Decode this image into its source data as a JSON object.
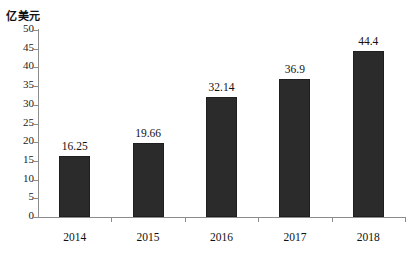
{
  "chart_data": {
    "type": "bar",
    "title": "",
    "subtitle": "",
    "xlabel": "",
    "ylabel": "亿美元",
    "categories": [
      "2014",
      "2015",
      "2016",
      "2017",
      "2018"
    ],
    "values": [
      16.25,
      19.66,
      32.14,
      36.9,
      44.4
    ],
    "value_labels": [
      "16.25",
      "19.66",
      "32.14",
      "36.9",
      "44.4"
    ],
    "series": [
      {
        "name": "亿美元",
        "values": [
          16.25,
          19.66,
          32.14,
          36.9,
          44.4
        ],
        "color": "#2b2b2b"
      }
    ],
    "ylim": [
      0,
      50
    ],
    "yticks": [
      0,
      5,
      10,
      15,
      20,
      25,
      30,
      35,
      40,
      45,
      50
    ],
    "ytick_labels": [
      "0",
      "5",
      "10",
      "15",
      "20",
      "25",
      "30",
      "35",
      "40",
      "45",
      "50"
    ],
    "grid": false,
    "legend": false,
    "legend_position": "none",
    "axis_color": "#8c8c8c",
    "background_color": "#ffffff",
    "bar_color": "#2b2b2b"
  }
}
